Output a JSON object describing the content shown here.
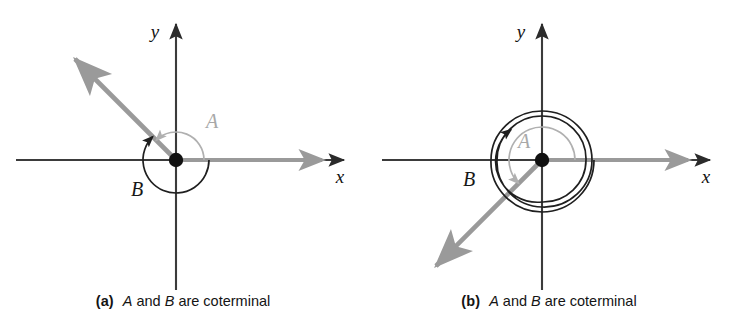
{
  "figure": {
    "colors": {
      "axis": "#3b3b3b",
      "dark_arc": "#1f1f1f",
      "light_arc": "#b0b0b0",
      "ray": "#9a9a9a",
      "origin_dot": "#111111",
      "background": "#ffffff"
    }
  },
  "panels": [
    {
      "id": "a",
      "tag": "(a)",
      "caption": {
        "var1": "A",
        "mid": " and ",
        "var2": "B",
        "tail": " are coterminal"
      },
      "axes": {
        "x_label": "x",
        "y_label": "y"
      },
      "origin": {
        "x": 176,
        "y": 160
      },
      "angles": [
        {
          "name": "A",
          "label": "A",
          "style": "light",
          "direction": "counterclockwise",
          "start_deg": 0,
          "end_deg": 135,
          "radius": 28,
          "label_pos": {
            "x": 212,
            "y": 128
          }
        },
        {
          "name": "B",
          "label": "B",
          "style": "dark",
          "direction": "clockwise",
          "start_deg": 0,
          "end_deg": -225,
          "radius": 33,
          "label_pos": {
            "x": 137,
            "y": 196
          }
        }
      ],
      "terminal_ray": {
        "angle_deg": 135,
        "length": 148
      },
      "initial_ray": {
        "angle_deg": 0,
        "length": 150
      }
    },
    {
      "id": "b",
      "tag": "(b)",
      "caption": {
        "var1": "A",
        "mid": " and ",
        "var2": "B",
        "tail": " are coterminal"
      },
      "axes": {
        "x_label": "x",
        "y_label": "y"
      },
      "origin": {
        "x": 176,
        "y": 160
      },
      "angles": [
        {
          "name": "A",
          "label": "A",
          "style": "light",
          "direction": "counterclockwise",
          "start_deg": 0,
          "end_deg": 225,
          "radius": 33,
          "label_pos": {
            "x": 158,
            "y": 132
          }
        },
        {
          "name": "B",
          "label": "B",
          "style": "dark",
          "direction": "counterclockwise",
          "start_deg": 0,
          "end_deg": 945,
          "revolutions": 2,
          "radius_start": 52,
          "radius_end": 40,
          "label_pos": {
            "x": 103,
            "y": 186
          }
        }
      ],
      "terminal_ray": {
        "angle_deg": 225,
        "length": 150
      },
      "initial_ray": {
        "angle_deg": 0,
        "length": 150
      }
    }
  ]
}
